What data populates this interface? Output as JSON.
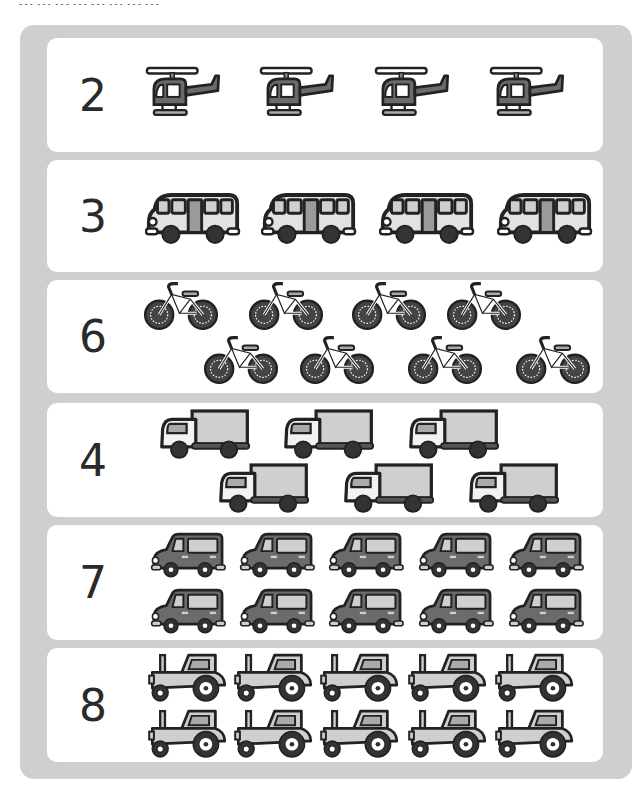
{
  "header": {
    "cut_text": "……………………"
  },
  "colors": {
    "panel": "#cfcfcf",
    "card": "#ffffff",
    "dark": "#2a2a2a",
    "mid": "#6b6b6b",
    "light": "#cfcfcf"
  },
  "rows": [
    {
      "number": "2",
      "vehicle": "helicopter",
      "icon_count": 4
    },
    {
      "number": "3",
      "vehicle": "bus",
      "icon_count": 4
    },
    {
      "number": "6",
      "vehicle": "bicycle",
      "icon_count": 8
    },
    {
      "number": "4",
      "vehicle": "truck",
      "icon_count": 6
    },
    {
      "number": "7",
      "vehicle": "car",
      "icon_count": 10
    },
    {
      "number": "8",
      "vehicle": "tractor",
      "icon_count": 10
    }
  ]
}
